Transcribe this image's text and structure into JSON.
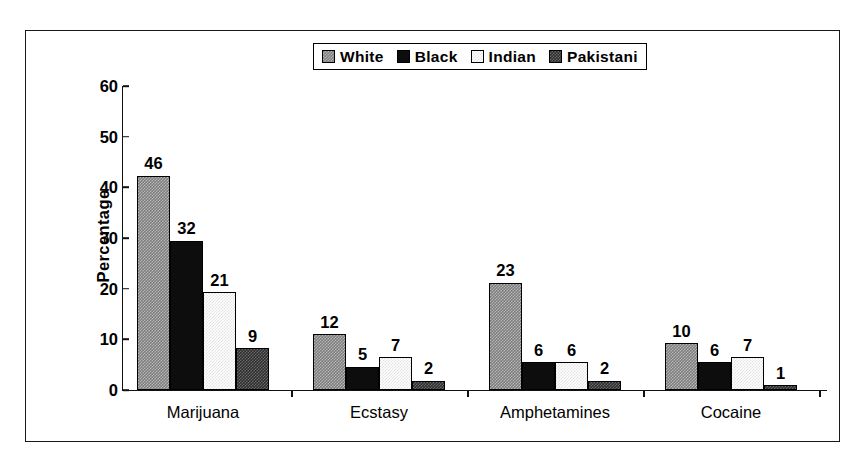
{
  "chart_data": {
    "type": "bar",
    "title": "",
    "subtitle": "",
    "xlabel": "",
    "ylabel": "Percentage",
    "ylim": [
      0,
      60
    ],
    "yticks": [
      0,
      10,
      20,
      30,
      40,
      50,
      60
    ],
    "grid": false,
    "legend_position": "top-center",
    "categories": [
      "Marijuana",
      "Ecstasy",
      "Amphetamines",
      "Cocaine"
    ],
    "series": [
      {
        "name": "White",
        "values": [
          46,
          12,
          23,
          10
        ],
        "fill": "checkered-gray",
        "color": "#7d7d7d"
      },
      {
        "name": "Black",
        "values": [
          32,
          5,
          6,
          6
        ],
        "fill": "solid-black",
        "color": "#0d0d0d"
      },
      {
        "name": "Indian",
        "values": [
          21,
          7,
          6,
          7
        ],
        "fill": "white-outlined",
        "color": "#ffffff"
      },
      {
        "name": "Pakistani",
        "values": [
          9,
          2,
          2,
          1
        ],
        "fill": "checkered-dark-gray",
        "color": "#2e2e2e"
      }
    ]
  },
  "legend": {
    "items": [
      {
        "label": "White"
      },
      {
        "label": "Black"
      },
      {
        "label": "Indian"
      },
      {
        "label": "Pakistani"
      }
    ]
  },
  "axis": {
    "y_title": "Percentage",
    "y_tick_labels": [
      "60",
      "50",
      "40",
      "30",
      "20",
      "10",
      "0"
    ],
    "x_tick_labels": [
      "Marijuana",
      "Ecstasy",
      "Amphetamines",
      "Cocaine"
    ]
  }
}
